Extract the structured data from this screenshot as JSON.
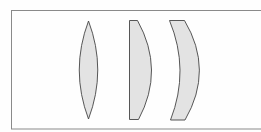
{
  "diagram": {
    "title": "",
    "frame": {
      "x": 11,
      "y": 10,
      "width": 252,
      "height": 119,
      "stroke": "#8a8a8a"
    },
    "style": {
      "lens_fill": "#e3e3e3",
      "lens_stroke": "#444444"
    },
    "lenses": [
      {
        "id": "biconvex",
        "label": "Biconvex lens",
        "type": "biconvex"
      },
      {
        "id": "plano-convex",
        "label": "Plano-convex lens",
        "type": "plano-convex"
      },
      {
        "id": "meniscus",
        "label": "Positive meniscus lens",
        "type": "meniscus"
      }
    ]
  }
}
